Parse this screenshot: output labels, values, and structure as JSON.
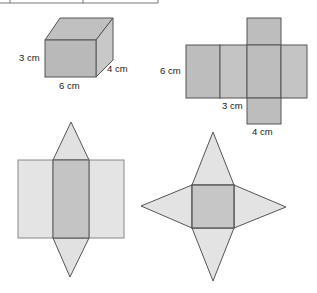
{
  "figure": {
    "table_fragment": {
      "columns": 3
    },
    "cuboid": {
      "labels": {
        "height": "3 cm",
        "width": "6 cm",
        "depth": "4 cm"
      },
      "colors": {
        "front": "#b9b9b9",
        "top": "#c2c2c2",
        "side": "#c9c9c9",
        "stroke": "#555555"
      }
    },
    "cuboid_net": {
      "labels": {
        "height": "6 cm",
        "middle": "3 cm",
        "bottom": "4 cm"
      },
      "colors": {
        "face": "#bdbdbd",
        "face_light": "#c6c6c6",
        "stroke": "#555555"
      }
    },
    "prism_net": {
      "colors": {
        "outer": "#e4e4e4",
        "middle": "#c4c4c4",
        "triangle": "#e1e1e1",
        "stroke": "#555555"
      }
    },
    "pyramid_net": {
      "colors": {
        "base": "#c6c6c6",
        "triangle": "#e3e3e3",
        "stroke": "#555555"
      }
    }
  }
}
